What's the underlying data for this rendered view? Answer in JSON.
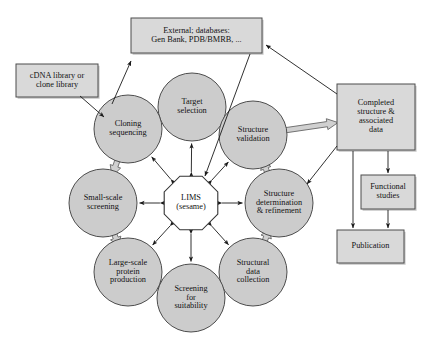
{
  "figure": {
    "background": "#ffffff",
    "node_fill": "#cccccc",
    "node_stroke": "#4d4d4d",
    "box_fill": "#d9d9d9",
    "box_stroke": "#4d4d4d",
    "hub_fill": "#ffffff",
    "arrow_thin_color": "#1a1a1a",
    "arrow_block_fill": "#d0d0d0",
    "arrow_block_stroke": "#666666"
  },
  "hub": {
    "name": "LIMS",
    "lines": [
      "LIMS",
      "(sesame)"
    ]
  },
  "cycle_nodes": [
    {
      "id": "target-selection",
      "lines": [
        "Target",
        "selection"
      ],
      "cx": 192,
      "cy": 107,
      "r": 34
    },
    {
      "id": "structure-validation",
      "lines": [
        "Structure",
        "validation"
      ],
      "cx": 253,
      "cy": 135,
      "r": 34
    },
    {
      "id": "structure-determination",
      "lines": [
        "Structure",
        "determination",
        "& refinement"
      ],
      "cx": 279,
      "cy": 203,
      "r": 34
    },
    {
      "id": "structural-data-collection",
      "lines": [
        "Structural",
        "data",
        "collection"
      ],
      "cx": 253,
      "cy": 272,
      "r": 34
    },
    {
      "id": "screening-for-suitability",
      "lines": [
        "Screening",
        "for",
        "suitability"
      ],
      "cx": 191,
      "cy": 298,
      "r": 34
    },
    {
      "id": "large-scale-protein-production",
      "lines": [
        "Large-scale",
        "protein",
        "production"
      ],
      "cx": 128,
      "cy": 272,
      "r": 34
    },
    {
      "id": "small-scale-screening",
      "lines": [
        "Small-scale",
        "screening"
      ],
      "cx": 103,
      "cy": 203,
      "r": 34
    },
    {
      "id": "cloning-sequencing",
      "lines": [
        "Cloning",
        "sequencing"
      ],
      "cx": 128,
      "cy": 129,
      "r": 34
    }
  ],
  "boxes": [
    {
      "id": "cdna-library",
      "lines": [
        "cDNA library or",
        "clone library"
      ],
      "x": 16,
      "y": 64,
      "w": 82,
      "h": 33
    },
    {
      "id": "external-databases",
      "lines": [
        "External; databases:",
        "Gen Bank, PDB/BMRB, ..."
      ],
      "x": 131,
      "y": 18,
      "w": 131,
      "h": 35
    },
    {
      "id": "completed-structure",
      "lines": [
        "Completed",
        "structure &",
        "associated",
        "data"
      ],
      "x": 337,
      "y": 84,
      "w": 78,
      "h": 66
    },
    {
      "id": "functional-studies",
      "lines": [
        "Functional",
        "studies"
      ],
      "x": 361,
      "y": 175,
      "w": 54,
      "h": 34
    },
    {
      "id": "publication",
      "lines": [
        "Publication"
      ],
      "x": 337,
      "y": 230,
      "w": 67,
      "h": 33
    }
  ],
  "connections": {
    "hub_spokes": [
      {
        "from": "LIMS",
        "to": "target-selection",
        "style": "double-headed-thin"
      },
      {
        "from": "LIMS",
        "to": "structure-validation",
        "style": "double-headed-thin"
      },
      {
        "from": "LIMS",
        "to": "structure-determination",
        "style": "double-headed-thin"
      },
      {
        "from": "LIMS",
        "to": "structural-data-collection",
        "style": "double-headed-thin"
      },
      {
        "from": "LIMS",
        "to": "screening-for-suitability",
        "style": "double-headed-thin"
      },
      {
        "from": "LIMS",
        "to": "large-scale-protein-production",
        "style": "double-headed-thin"
      },
      {
        "from": "LIMS",
        "to": "small-scale-screening",
        "style": "double-headed-thin"
      },
      {
        "from": "LIMS",
        "to": "cloning-sequencing",
        "style": "double-headed-thin"
      }
    ],
    "cycle_flow": [
      {
        "from": "target-selection",
        "to": "cloning-sequencing",
        "style": "block-arrow"
      },
      {
        "from": "cloning-sequencing",
        "to": "small-scale-screening",
        "style": "block-arrow"
      },
      {
        "from": "small-scale-screening",
        "to": "large-scale-protein-production",
        "style": "block-arrow"
      },
      {
        "from": "large-scale-protein-production",
        "to": "screening-for-suitability",
        "style": "block-arrow"
      },
      {
        "from": "screening-for-suitability",
        "to": "structural-data-collection",
        "style": "block-arrow"
      },
      {
        "from": "structural-data-collection",
        "to": "structure-determination",
        "style": "block-arrow"
      },
      {
        "from": "structure-determination",
        "to": "structure-validation",
        "style": "block-arrow"
      },
      {
        "from": "structure-validation",
        "to": "completed-structure",
        "style": "block-arrow"
      }
    ],
    "external": [
      {
        "from": "cdna-library",
        "to": "cloning-sequencing",
        "style": "thin-arrow"
      },
      {
        "from": "cloning-sequencing",
        "to": "external-databases",
        "style": "thin-arrow"
      },
      {
        "from": "external-databases",
        "to": "LIMS",
        "style": "thin-arrow"
      },
      {
        "from": "completed-structure",
        "to": "external-databases",
        "style": "thin-arrow"
      },
      {
        "from": "completed-structure",
        "to": "structure-determination",
        "style": "thin-arrow"
      },
      {
        "from": "completed-structure",
        "to": "functional-studies",
        "style": "thin-arrow"
      },
      {
        "from": "completed-structure",
        "to": "publication",
        "style": "thin-arrow"
      },
      {
        "from": "functional-studies",
        "to": "publication",
        "style": "thin-arrow"
      }
    ]
  }
}
